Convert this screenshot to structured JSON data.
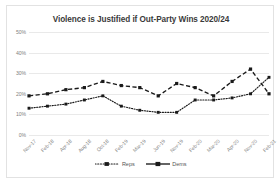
{
  "chart_data": {
    "type": "line",
    "title": "Violence is Justified if Out-Party Wins 2020/24",
    "xlabel": "",
    "ylabel": "",
    "ylim": [
      0,
      50
    ],
    "yticks": [
      "0%",
      "10%",
      "20%",
      "30%",
      "40%",
      "50%"
    ],
    "ytick_values": [
      0,
      10,
      20,
      30,
      40,
      50
    ],
    "grid": true,
    "legend_position": "bottom",
    "categories": [
      "Nov-17",
      "Feb-18",
      "Apr-18",
      "Aug-18",
      "Oct-18",
      "Feb-19",
      "Mar-19",
      "Jun-19",
      "Nov-19",
      "Feb-20",
      "Mar-20",
      "Apr-20",
      "Nov-20",
      "Feb-21"
    ],
    "series": [
      {
        "name": "Reps",
        "style": "dotted",
        "values": [
          13,
          14,
          15,
          17,
          19,
          14,
          12,
          11,
          11,
          17,
          17,
          18,
          20,
          28
        ]
      },
      {
        "name": "Dems",
        "style": "dashed",
        "values": [
          19,
          20,
          22,
          23,
          26,
          24,
          23,
          19,
          25,
          23,
          19,
          26,
          32,
          20
        ]
      }
    ]
  },
  "legend": {
    "entries": [
      {
        "label": "Reps"
      },
      {
        "label": "Dems"
      }
    ]
  }
}
